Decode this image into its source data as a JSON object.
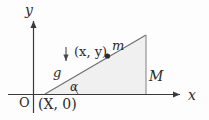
{
  "figure": {
    "background_color": "#fdfdfd",
    "stroke_color": "#5a5a5a",
    "axis_color": "#3a3a3a",
    "fill_color": "#f0f0f0",
    "text_color": "#2b2b2b"
  },
  "axes": {
    "y_label": "y",
    "x_label": "x",
    "origin_label": "O",
    "y_axis": {
      "x": 33,
      "y_top": 18,
      "y_bottom": 113,
      "arrow": "up"
    },
    "x_axis": {
      "y": 94,
      "x_left": 8,
      "x_right": 183,
      "arrow": "right"
    }
  },
  "wedge": {
    "vertices": [
      {
        "name": "base-left",
        "x": 45,
        "y": 94,
        "label": "(X, 0)"
      },
      {
        "name": "apex",
        "x": 146,
        "y": 35
      },
      {
        "name": "base-right",
        "x": 146,
        "y": 94
      }
    ],
    "mass_label": "M",
    "angle_label": "α"
  },
  "block": {
    "point": {
      "x": 107,
      "y": 56
    },
    "coord_label": "(x, y)",
    "coord_label_open": "(",
    "coord_label_x": "x",
    "coord_label_comma": ", ",
    "coord_label_y": "y",
    "coord_label_close": ")",
    "mass_label": "m"
  },
  "gravity": {
    "label": "g",
    "arrow": {
      "x": 66,
      "y_top": 47,
      "y_bottom": 64,
      "direction": "down"
    }
  }
}
